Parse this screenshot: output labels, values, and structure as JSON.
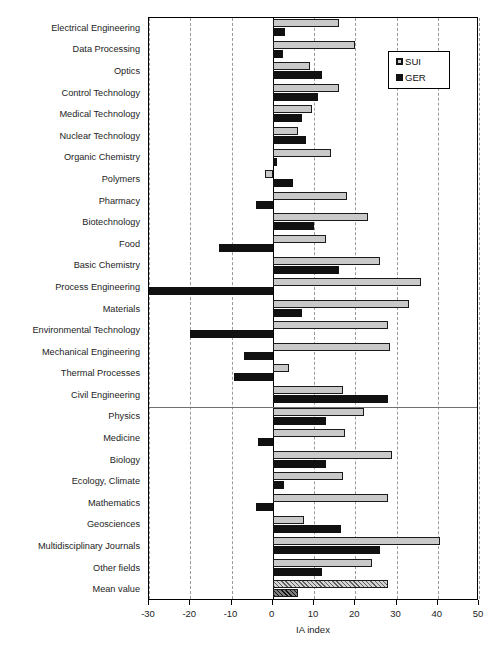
{
  "chart_data": {
    "type": "bar",
    "orientation": "horizontal",
    "title": "",
    "xlabel": "IA index",
    "ylabel": "",
    "xlim": [
      -30,
      50
    ],
    "xticks": [
      -30,
      -20,
      -10,
      0,
      10,
      20,
      30,
      40,
      50
    ],
    "xticklabels": [
      "-30",
      "-20",
      "-10",
      "0",
      "10",
      "20",
      "30",
      "40",
      "50"
    ],
    "grid": "vertical-dashed",
    "legend_position": "top-right",
    "legend": [
      "SUI",
      "GER"
    ],
    "categories": [
      "Electrical Engineering",
      "Data Processing",
      "Optics",
      "Control Technology",
      "Medical Technology",
      "Nuclear Technology",
      "Organic Chemistry",
      "Polymers",
      "Pharmacy",
      "Biotechnology",
      "Food",
      "Basic Chemistry",
      "Process Engineering",
      "Materials",
      "Environmental Technology",
      "Mechanical Engineering",
      "Thermal Processes",
      "Civil Engineering",
      "Physics",
      "Medicine",
      "Biology",
      "Ecology, Climate",
      "Mathematics",
      "Geosciences",
      "Multidisciplinary Journals",
      "Other fields",
      "Mean value"
    ],
    "series": [
      {
        "name": "SUI",
        "color": "#c9c9c9",
        "values": [
          16.0,
          20.0,
          9.0,
          16.0,
          9.5,
          6.0,
          14.0,
          -2.0,
          18.0,
          23.0,
          13.0,
          26.0,
          36.0,
          33.0,
          28.0,
          28.5,
          4.0,
          17.0,
          22.0,
          17.5,
          29.0,
          17.0,
          28.0,
          7.5,
          40.5,
          24.0,
          28.0
        ]
      },
      {
        "name": "GER",
        "color": "#111111",
        "values": [
          3.0,
          2.5,
          12.0,
          11.0,
          7.0,
          8.0,
          1.0,
          5.0,
          -4.0,
          10.0,
          -13.0,
          16.0,
          -30.0,
          7.0,
          -20.0,
          -7.0,
          -9.5,
          28.0,
          13.0,
          -3.5,
          13.0,
          2.7,
          -4.0,
          16.5,
          26.0,
          12.0,
          6.0
        ]
      }
    ],
    "highlighted_category": "Mean value",
    "section_divider_after": "Civil Engineering"
  }
}
